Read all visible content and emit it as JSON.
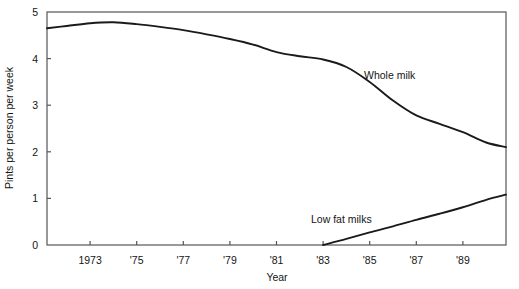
{
  "chart_data": {
    "type": "line",
    "title": "",
    "xlabel": "Year",
    "ylabel": "Pints per person per week",
    "xlim": [
      1971.15,
      1990.85
    ],
    "ylim": [
      0,
      5
    ],
    "grid": false,
    "legend_position": "inline-annotations",
    "x_tick_labels": [
      "1973",
      "'75",
      "'77",
      "'79",
      "'81",
      "'83",
      "'85",
      "'87",
      "'89"
    ],
    "x_tick_values": [
      1973,
      1975,
      1977,
      1979,
      1981,
      1983,
      1985,
      1987,
      1989
    ],
    "y_tick_labels": [
      "0",
      "1",
      "2",
      "3",
      "4",
      "5"
    ],
    "y_tick_values": [
      0,
      1,
      2,
      3,
      4,
      5
    ],
    "series": [
      {
        "name": "Whole milk",
        "annotation": "Whole milk",
        "x": [
          1971.15,
          1972,
          1973,
          1974,
          1975,
          1976,
          1977,
          1978,
          1979,
          1980,
          1981,
          1982,
          1983,
          1984,
          1985,
          1986,
          1987,
          1988,
          1989,
          1990,
          1990.85
        ],
        "values": [
          4.65,
          4.7,
          4.76,
          4.78,
          4.74,
          4.68,
          4.61,
          4.52,
          4.42,
          4.3,
          4.14,
          4.05,
          3.98,
          3.82,
          3.5,
          3.1,
          2.78,
          2.6,
          2.42,
          2.2,
          2.1
        ]
      },
      {
        "name": "Low fat milks",
        "annotation": "Low fat milks",
        "x": [
          1983,
          1984,
          1985,
          1986,
          1987,
          1988,
          1989,
          1990,
          1990.85
        ],
        "values": [
          0,
          0.13,
          0.27,
          0.4,
          0.54,
          0.67,
          0.81,
          0.97,
          1.08
        ]
      }
    ]
  },
  "style": {
    "line_color": "#1a1a1a",
    "axis_color": "#555555",
    "text_color": "#151515",
    "background": "#ffffff"
  }
}
